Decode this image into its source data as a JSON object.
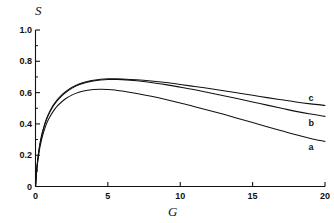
{
  "chart_data": {
    "type": "line",
    "title": "",
    "subtitle": "",
    "xlabel": "G",
    "ylabel": "S",
    "xlim": [
      0,
      20
    ],
    "ylim": [
      0,
      1.0
    ],
    "grid": false,
    "legend_position": "inline-right-end-labels",
    "xticks": [
      {
        "value": 0,
        "label": "0"
      },
      {
        "value": 5,
        "label": "5"
      },
      {
        "value": 10,
        "label": "10"
      },
      {
        "value": 15,
        "label": "15"
      },
      {
        "value": 20,
        "label": "20"
      }
    ],
    "x_minor_tick_interval": 1,
    "yticks": [
      {
        "value": 0,
        "label": "0"
      },
      {
        "value": 0.2,
        "label": "0.2"
      },
      {
        "value": 0.4,
        "label": "0.4"
      },
      {
        "value": 0.6,
        "label": "0.6"
      },
      {
        "value": 0.8,
        "label": "0.8"
      },
      {
        "value": 1.0,
        "label": "1.0"
      }
    ],
    "y_minor_tick_interval": 0.1,
    "series": [
      {
        "name": "a",
        "label": "a",
        "color": "#111111",
        "label_x": 19.0,
        "label_y": 0.255,
        "points": [
          [
            0.0,
            0.0
          ],
          [
            0.1,
            0.115
          ],
          [
            0.2,
            0.192
          ],
          [
            0.3,
            0.248
          ],
          [
            0.4,
            0.292
          ],
          [
            0.5,
            0.329
          ],
          [
            0.7,
            0.386
          ],
          [
            0.9,
            0.429
          ],
          [
            1.2,
            0.477
          ],
          [
            1.5,
            0.513
          ],
          [
            1.8,
            0.54
          ],
          [
            2.1,
            0.562
          ],
          [
            2.5,
            0.584
          ],
          [
            3.0,
            0.602
          ],
          [
            3.5,
            0.614
          ],
          [
            4.0,
            0.62
          ],
          [
            4.5,
            0.622
          ],
          [
            5.0,
            0.62
          ],
          [
            5.5,
            0.616
          ],
          [
            6.0,
            0.61
          ],
          [
            7.0,
            0.594
          ],
          [
            8.0,
            0.576
          ],
          [
            9.0,
            0.556
          ],
          [
            10.0,
            0.534
          ],
          [
            11.0,
            0.51
          ],
          [
            12.0,
            0.486
          ],
          [
            13.0,
            0.461
          ],
          [
            14.0,
            0.435
          ],
          [
            15.0,
            0.409
          ],
          [
            16.0,
            0.382
          ],
          [
            17.0,
            0.356
          ],
          [
            18.0,
            0.33
          ],
          [
            19.0,
            0.307
          ],
          [
            20.0,
            0.288
          ]
        ]
      },
      {
        "name": "b",
        "label": "b",
        "color": "#111111",
        "label_x": 19.0,
        "label_y": 0.405,
        "points": [
          [
            0.0,
            0.0
          ],
          [
            0.1,
            0.122
          ],
          [
            0.2,
            0.205
          ],
          [
            0.3,
            0.265
          ],
          [
            0.4,
            0.312
          ],
          [
            0.5,
            0.351
          ],
          [
            0.7,
            0.412
          ],
          [
            0.9,
            0.458
          ],
          [
            1.2,
            0.51
          ],
          [
            1.5,
            0.548
          ],
          [
            1.8,
            0.578
          ],
          [
            2.1,
            0.602
          ],
          [
            2.5,
            0.627
          ],
          [
            3.0,
            0.65
          ],
          [
            3.5,
            0.665
          ],
          [
            4.0,
            0.675
          ],
          [
            4.5,
            0.681
          ],
          [
            5.0,
            0.684
          ],
          [
            5.5,
            0.684
          ],
          [
            6.0,
            0.683
          ],
          [
            7.0,
            0.676
          ],
          [
            8.0,
            0.665
          ],
          [
            9.0,
            0.651
          ],
          [
            10.0,
            0.635
          ],
          [
            11.0,
            0.618
          ],
          [
            12.0,
            0.599
          ],
          [
            13.0,
            0.58
          ],
          [
            14.0,
            0.56
          ],
          [
            15.0,
            0.54
          ],
          [
            16.0,
            0.52
          ],
          [
            17.0,
            0.5
          ],
          [
            18.0,
            0.48
          ],
          [
            19.0,
            0.463
          ],
          [
            20.0,
            0.448
          ]
        ]
      },
      {
        "name": "c",
        "label": "c",
        "color": "#111111",
        "label_x": 19.0,
        "label_y": 0.565,
        "points": [
          [
            0.0,
            0.0
          ],
          [
            0.1,
            0.124
          ],
          [
            0.2,
            0.208
          ],
          [
            0.3,
            0.269
          ],
          [
            0.4,
            0.317
          ],
          [
            0.5,
            0.356
          ],
          [
            0.7,
            0.418
          ],
          [
            0.9,
            0.464
          ],
          [
            1.2,
            0.516
          ],
          [
            1.5,
            0.554
          ],
          [
            1.8,
            0.584
          ],
          [
            2.1,
            0.608
          ],
          [
            2.5,
            0.633
          ],
          [
            3.0,
            0.655
          ],
          [
            3.5,
            0.67
          ],
          [
            4.0,
            0.679
          ],
          [
            4.5,
            0.685
          ],
          [
            5.0,
            0.688
          ],
          [
            5.5,
            0.688
          ],
          [
            6.0,
            0.687
          ],
          [
            7.0,
            0.682
          ],
          [
            8.0,
            0.674
          ],
          [
            9.0,
            0.664
          ],
          [
            10.0,
            0.652
          ],
          [
            11.0,
            0.639
          ],
          [
            12.0,
            0.626
          ],
          [
            13.0,
            0.612
          ],
          [
            14.0,
            0.597
          ],
          [
            15.0,
            0.583
          ],
          [
            16.0,
            0.568
          ],
          [
            17.0,
            0.554
          ],
          [
            18.0,
            0.54
          ],
          [
            19.0,
            0.528
          ],
          [
            20.0,
            0.518
          ]
        ]
      }
    ]
  },
  "axes": {
    "y_variable": "S",
    "x_variable": "G"
  }
}
